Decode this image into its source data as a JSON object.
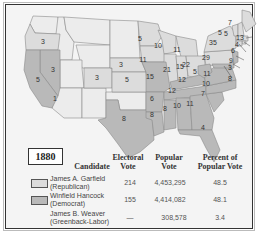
{
  "map": {
    "year": "1880",
    "colors": {
      "republican": "#dcdcdc",
      "democrat": "#b9b9b9",
      "territory": "#ececec",
      "border": "#8a8a8a",
      "background": "#f4f4f4"
    },
    "electoral_labels": [
      {
        "state": "Oregon",
        "votes": "3"
      },
      {
        "state": "California",
        "votes": "5"
      },
      {
        "state": "California-1",
        "votes": "1"
      },
      {
        "state": "Nevada",
        "votes": "3"
      },
      {
        "state": "Colorado",
        "votes": "3"
      },
      {
        "state": "Nebraska",
        "votes": "3"
      },
      {
        "state": "Kansas",
        "votes": "5"
      },
      {
        "state": "Texas",
        "votes": "8"
      },
      {
        "state": "Minnesota",
        "votes": "5"
      },
      {
        "state": "Iowa",
        "votes": "11"
      },
      {
        "state": "Missouri",
        "votes": "15"
      },
      {
        "state": "Arkansas",
        "votes": "6"
      },
      {
        "state": "Louisiana",
        "votes": "8"
      },
      {
        "state": "Wisconsin",
        "votes": "10"
      },
      {
        "state": "Illinois",
        "votes": "21"
      },
      {
        "state": "Michigan",
        "votes": "11"
      },
      {
        "state": "Indiana",
        "votes": "15"
      },
      {
        "state": "Ohio",
        "votes": "22"
      },
      {
        "state": "Kentucky",
        "votes": "12"
      },
      {
        "state": "Tennessee",
        "votes": "12"
      },
      {
        "state": "Mississippi",
        "votes": "8"
      },
      {
        "state": "Alabama",
        "votes": "10"
      },
      {
        "state": "Georgia",
        "votes": "11"
      },
      {
        "state": "Florida",
        "votes": "4"
      },
      {
        "state": "South Carolina",
        "votes": "7"
      },
      {
        "state": "North Carolina",
        "votes": "10"
      },
      {
        "state": "Virginia",
        "votes": "11"
      },
      {
        "state": "West Virginia",
        "votes": "5"
      },
      {
        "state": "Pennsylvania",
        "votes": "29"
      },
      {
        "state": "New York",
        "votes": "35"
      },
      {
        "state": "Vermont",
        "votes": "5"
      },
      {
        "state": "New Hampshire",
        "votes": "5"
      },
      {
        "state": "Maine",
        "votes": "7"
      },
      {
        "state": "Massachusetts",
        "votes": "13"
      },
      {
        "state": "Rhode Island",
        "votes": "4"
      },
      {
        "state": "Connecticut",
        "votes": "6"
      },
      {
        "state": "New Jersey",
        "votes": "9"
      },
      {
        "state": "Delaware",
        "votes": "3"
      },
      {
        "state": "Maryland",
        "votes": "8"
      }
    ]
  },
  "table": {
    "headers": {
      "candidate": "Candidate",
      "electoral_1": "Electoral",
      "electoral_2": "Vote",
      "popular_1": "Popular",
      "popular_2": "Vote",
      "percent_1": "Percent of",
      "percent_2": "Popular Vote"
    },
    "rows": [
      {
        "name": "James A. Garfield",
        "party": "(Republican)",
        "electoral": "214",
        "popular": "4,453,295",
        "percent": "48.5",
        "swatch": "#dcdcdc"
      },
      {
        "name": "Winfield Hancock",
        "party": "(Democrat)",
        "electoral": "155",
        "popular": "4,414,082",
        "percent": "48.1",
        "swatch": "#b9b9b9"
      },
      {
        "name": "James B. Weaver",
        "party": "(Greenback-Labor)",
        "electoral": "—",
        "popular": "308,578",
        "percent": "3.4",
        "swatch": ""
      }
    ]
  }
}
